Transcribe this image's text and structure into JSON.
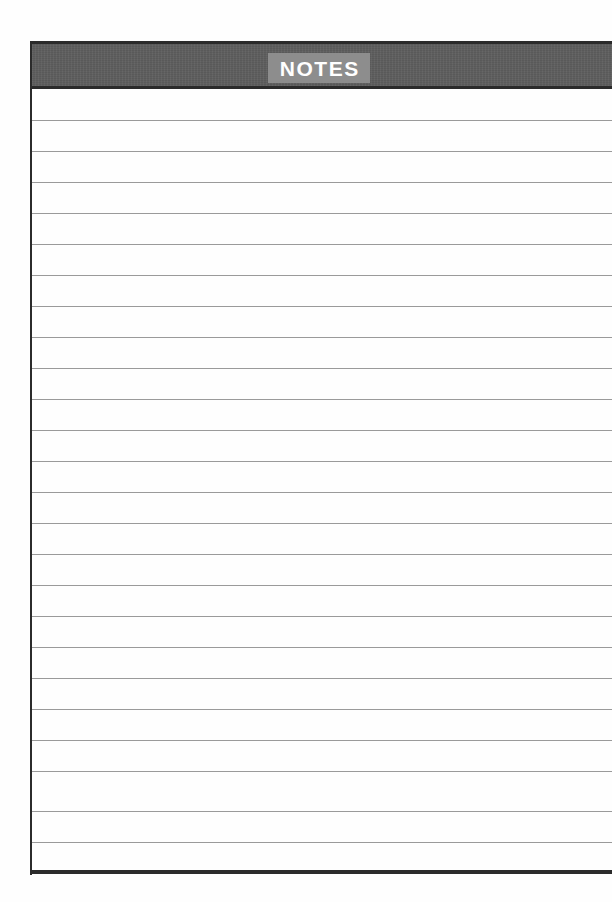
{
  "page": {
    "kind": "lined-notes-page",
    "background_color": "#ffffff",
    "width": 612,
    "height": 902
  },
  "header": {
    "title": "NOTES",
    "bar_color": "#5e5e5e",
    "bar_border_color": "#2b2b2b",
    "title_highlight_color": "#8d8d8d",
    "title_text_color": "#ffffff"
  },
  "ruled_area": {
    "line_color": "#9a9a9a",
    "left_margin_rule_color": "#2b2b2b",
    "bottom_border_color": "#2b2b2b",
    "line_spacing_px": 31,
    "first_line_y": 120,
    "line_count": 24,
    "lines": [
      {
        "index": 1,
        "y": 120,
        "text": ""
      },
      {
        "index": 2,
        "y": 151,
        "text": ""
      },
      {
        "index": 3,
        "y": 182,
        "text": ""
      },
      {
        "index": 4,
        "y": 213,
        "text": ""
      },
      {
        "index": 5,
        "y": 244,
        "text": ""
      },
      {
        "index": 6,
        "y": 275,
        "text": ""
      },
      {
        "index": 7,
        "y": 306,
        "text": ""
      },
      {
        "index": 8,
        "y": 337,
        "text": ""
      },
      {
        "index": 9,
        "y": 368,
        "text": ""
      },
      {
        "index": 10,
        "y": 399,
        "text": ""
      },
      {
        "index": 11,
        "y": 430,
        "text": ""
      },
      {
        "index": 12,
        "y": 461,
        "text": ""
      },
      {
        "index": 13,
        "y": 492,
        "text": ""
      },
      {
        "index": 14,
        "y": 523,
        "text": ""
      },
      {
        "index": 15,
        "y": 554,
        "text": ""
      },
      {
        "index": 16,
        "y": 585,
        "text": ""
      },
      {
        "index": 17,
        "y": 616,
        "text": ""
      },
      {
        "index": 18,
        "y": 647,
        "text": ""
      },
      {
        "index": 19,
        "y": 678,
        "text": ""
      },
      {
        "index": 20,
        "y": 709,
        "text": ""
      },
      {
        "index": 21,
        "y": 740,
        "text": ""
      },
      {
        "index": 22,
        "y": 771,
        "text": ""
      },
      {
        "index": 23,
        "y": 811,
        "text": ""
      },
      {
        "index": 24,
        "y": 842,
        "text": ""
      }
    ]
  }
}
